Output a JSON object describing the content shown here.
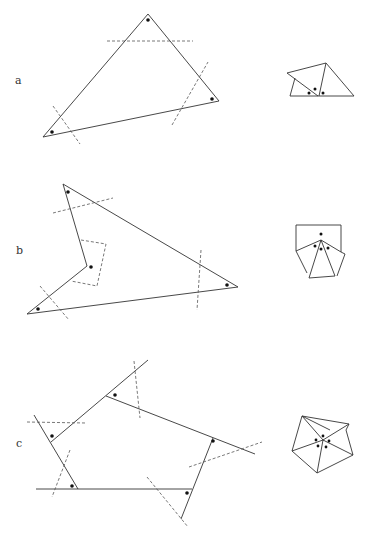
{
  "panels": [
    {
      "label": "a",
      "description": "Triangle with angle cuts; angles rearranged into a straight line"
    },
    {
      "label": "b",
      "description": "Concave quadrilateral with angle cuts; angles rearranged around a point"
    },
    {
      "label": "c",
      "description": "Pentagon with extended sides; exterior angles rearranged around a point"
    }
  ],
  "colors": {
    "edge": "#333333",
    "dash": "#555555",
    "dot": "#111111"
  }
}
